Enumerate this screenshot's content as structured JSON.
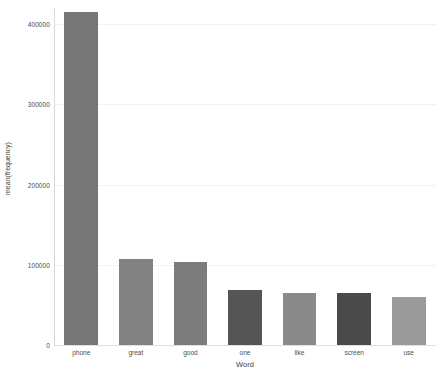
{
  "chart_data": {
    "type": "bar",
    "title": "",
    "xlabel": "Word",
    "ylabel": "mean(frequency)",
    "categories": [
      "phone",
      "great",
      "good",
      "one",
      "like",
      "screen",
      "use"
    ],
    "values": [
      415000,
      107500,
      103750,
      68750,
      65000,
      65000,
      60000
    ],
    "bar_colors": [
      "#767676",
      "#818181",
      "#7c7c7c",
      "#555555",
      "#8a8a8a",
      "#4a4a4a",
      "#9a9a9a"
    ],
    "ylim": [
      0,
      420000
    ],
    "yticks": [
      0,
      100000,
      200000,
      300000,
      400000
    ],
    "ytick_labels": [
      "0",
      "100000",
      "200000",
      "300000",
      "400000"
    ],
    "grid": true,
    "gridline_color": "#f2f2f2",
    "legend": "none",
    "background": "#ffffff",
    "axis_color": "#d9d9d9",
    "tick_label_color": "#4d4d4d"
  },
  "top_artifact": {
    "text": ""
  }
}
